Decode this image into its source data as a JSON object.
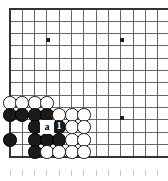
{
  "diagram": {
    "type": "go-board-corner",
    "board": {
      "background_color": "#ffffff",
      "line_color": "#555555",
      "edge_color": "#333333",
      "star_point_color": "#222222",
      "cell_size": 12.3,
      "origin_x": 10,
      "origin_y": 9,
      "cols": 13,
      "rows": 13,
      "edges": {
        "left": true,
        "top": true,
        "bottom": true,
        "right": false
      },
      "star_points": [
        {
          "col": 3,
          "row": 2,
          "x": 48,
          "y": 40
        },
        {
          "col": 9,
          "row": 2,
          "x": 122,
          "y": 40
        },
        {
          "col": 9,
          "row": 8,
          "x": 122,
          "y": 118
        }
      ]
    },
    "stones": [
      {
        "color": "white",
        "col": 0,
        "row": 7,
        "x": 10,
        "y": 103,
        "label": ""
      },
      {
        "color": "white",
        "col": 1,
        "row": 7,
        "x": 22,
        "y": 103,
        "label": ""
      },
      {
        "color": "white",
        "col": 2,
        "row": 7,
        "x": 35,
        "y": 103,
        "label": ""
      },
      {
        "color": "white",
        "col": 3,
        "row": 7,
        "x": 47,
        "y": 103,
        "label": ""
      },
      {
        "color": "black",
        "col": 0,
        "row": 8,
        "x": 10,
        "y": 115,
        "label": ""
      },
      {
        "color": "black",
        "col": 1,
        "row": 8,
        "x": 22,
        "y": 115,
        "label": ""
      },
      {
        "color": "black",
        "col": 2,
        "row": 8,
        "x": 35,
        "y": 115,
        "label": ""
      },
      {
        "color": "black",
        "col": 3,
        "row": 8,
        "x": 47,
        "y": 115,
        "label": ""
      },
      {
        "color": "white",
        "col": 4,
        "row": 8,
        "x": 59,
        "y": 115,
        "label": ""
      },
      {
        "color": "white",
        "col": 5,
        "row": 8,
        "x": 72,
        "y": 115,
        "label": ""
      },
      {
        "color": "white",
        "col": 6,
        "row": 8,
        "x": 84,
        "y": 115,
        "label": ""
      },
      {
        "color": "black",
        "col": 2,
        "row": 9,
        "x": 35,
        "y": 127,
        "label": ""
      },
      {
        "color": "black",
        "col": 4,
        "row": 9,
        "x": 59,
        "y": 127,
        "label": "1"
      },
      {
        "color": "white",
        "col": 5,
        "row": 9,
        "x": 72,
        "y": 127,
        "label": ""
      },
      {
        "color": "white",
        "col": 6,
        "row": 9,
        "x": 84,
        "y": 127,
        "label": ""
      },
      {
        "color": "black",
        "col": 0,
        "row": 10,
        "x": 10,
        "y": 140,
        "label": ""
      },
      {
        "color": "black",
        "col": 2,
        "row": 10,
        "x": 35,
        "y": 140,
        "label": ""
      },
      {
        "color": "black",
        "col": 3,
        "row": 10,
        "x": 47,
        "y": 140,
        "label": ""
      },
      {
        "color": "black",
        "col": 4,
        "row": 10,
        "x": 59,
        "y": 140,
        "label": ""
      },
      {
        "color": "white",
        "col": 5,
        "row": 10,
        "x": 72,
        "y": 140,
        "label": ""
      },
      {
        "color": "white",
        "col": 6,
        "row": 10,
        "x": 84,
        "y": 140,
        "label": ""
      },
      {
        "color": "black",
        "col": 2,
        "row": 11,
        "x": 35,
        "y": 152,
        "label": ""
      },
      {
        "color": "white",
        "col": 3,
        "row": 11,
        "x": 47,
        "y": 152,
        "label": ""
      },
      {
        "color": "white",
        "col": 4,
        "row": 11,
        "x": 59,
        "y": 152,
        "label": ""
      },
      {
        "color": "white",
        "col": 5,
        "row": 11,
        "x": 72,
        "y": 152,
        "label": ""
      },
      {
        "color": "white",
        "col": 6,
        "row": 11,
        "x": 84,
        "y": 152,
        "label": ""
      }
    ],
    "point_labels": [
      {
        "text": "a",
        "col": 3,
        "row": 9,
        "x": 47,
        "y": 127
      }
    ],
    "move_markers": [
      {
        "text": "1",
        "col": 4,
        "row": 9,
        "on_color": "black",
        "text_color": "#ffffff"
      }
    ],
    "footer_ticks": {
      "visible": true,
      "y": 173,
      "count": 13,
      "color": "#b9b9b9"
    }
  }
}
